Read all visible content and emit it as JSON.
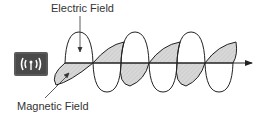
{
  "diagram": {
    "labels": {
      "electric_field": "Electric Field",
      "magnetic_field": "Magnetic Field"
    },
    "source_icon": "antenna-broadcast-icon",
    "colors": {
      "line": "#222222",
      "fill": "#d6d6d6",
      "source_box": "#555555",
      "text": "#333333"
    },
    "axis": {
      "y": 63,
      "x_start": 40,
      "x_end": 252
    },
    "nodes_x": [
      65,
      93,
      121,
      149,
      177,
      205,
      233
    ]
  }
}
